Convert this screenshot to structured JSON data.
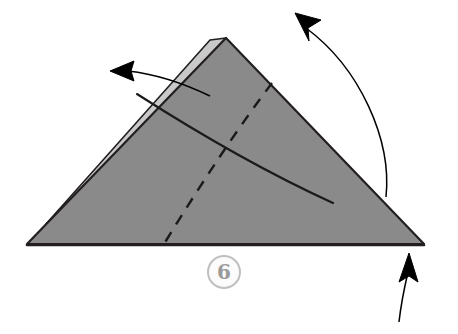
{
  "diagram": {
    "kind": "origami-fold-instruction",
    "step_label": "6",
    "background_color": "#ffffff"
  },
  "colors": {
    "paper_front": "#8a8a8a",
    "paper_back_flap": "#c9c9c9",
    "outline": "#231f20",
    "fold_line": "#1a1a1a",
    "arrow": "#000000",
    "badge_ring": "#bfbfbf",
    "badge_text": "#9a9a9a",
    "badge_fill": "#fbfbfb"
  },
  "shapes": {
    "main_triangle": {
      "name": "folded-paper-triangle",
      "points": "27,244 226,38 424,244",
      "fill": "#8a8a8a",
      "stroke": "#231f20",
      "stroke_width": 2.2
    },
    "back_flap": {
      "name": "paper-back-flap-edge",
      "points": "210,40 226,38 60,215 46,224",
      "fill": "#c9c9c9",
      "stroke": "#231f20",
      "stroke_width": 1.6
    },
    "baseline": {
      "name": "triangle-base-edge",
      "x1": 27,
      "y1": 245,
      "x2": 424,
      "y2": 245,
      "stroke": "#231f20",
      "stroke_width": 2.6
    }
  },
  "fold_lines": {
    "mountain_curve": {
      "name": "mountain-fold-curve",
      "path": "M 137,94 C 190,128 265,172 333,203",
      "stroke": "#1a1a1a",
      "stroke_width": 2.1,
      "style": "solid"
    },
    "valley_dashed": {
      "name": "valley-fold-dashed-line",
      "path": "M 272,83 C 240,125 200,185 164,244",
      "stroke": "#1a1a1a",
      "stroke_width": 2.4,
      "style": "dashed",
      "dash_pattern": "11 9"
    }
  },
  "arrows": [
    {
      "name": "fold-arrow-left",
      "direction": "left",
      "tip": {
        "x": 112,
        "y": 71
      },
      "path": "M 210,96 C 185,84 155,74 128,71",
      "head_points": "110,71 134,61 131,71 134,81",
      "stroke": "#000000",
      "stroke_width": 1.5
    },
    {
      "name": "fold-arrow-upper-right",
      "direction": "up-left",
      "tip": {
        "x": 296,
        "y": 14
      },
      "path": "M 386,197 C 392,140 360,68 306,28",
      "head_points": "295,13 321,20 308,28 309,41",
      "stroke": "#000000",
      "stroke_width": 1.5
    },
    {
      "name": "fold-arrow-bottom-right",
      "direction": "up",
      "tip": {
        "x": 409,
        "y": 254
      },
      "path": "M 399,322 C 401,304 405,285 408,272",
      "head_points": "409,253 418,282 409,276 399,282",
      "stroke": "#000000",
      "stroke_width": 1.5
    }
  ]
}
